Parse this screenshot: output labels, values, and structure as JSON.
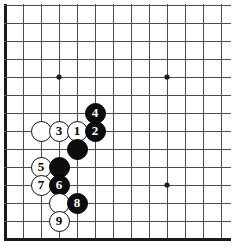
{
  "diagram": {
    "type": "go-board-corner-diagram",
    "board": {
      "columns": 13,
      "rows": 14,
      "origin_x": 5,
      "origin_y": 5,
      "spacing": 18,
      "line_color": "#4d4d4d",
      "border_color": "#1a1a1a",
      "background_color": "#ffffff"
    },
    "star_points": [
      {
        "name": "star-point-1",
        "col": 4,
        "row": 5
      },
      {
        "name": "star-point-2",
        "col": 10,
        "row": 5
      },
      {
        "name": "star-point-3",
        "col": 10,
        "row": 11
      }
    ],
    "stones": [
      {
        "name": "stone-white-unnumbered-c3r8",
        "color": "white",
        "label": "",
        "col": 3,
        "row": 8
      },
      {
        "name": "stone-white-3",
        "color": "white",
        "label": "3",
        "col": 4,
        "row": 8
      },
      {
        "name": "stone-white-1",
        "color": "white",
        "label": "1",
        "col": 5,
        "row": 8
      },
      {
        "name": "stone-black-2",
        "color": "black",
        "label": "2",
        "col": 6,
        "row": 8
      },
      {
        "name": "stone-black-4",
        "color": "black",
        "label": "4",
        "col": 6,
        "row": 7
      },
      {
        "name": "stone-black-unnumbered-c5r9",
        "color": "black",
        "label": "",
        "col": 5,
        "row": 9
      },
      {
        "name": "stone-white-5",
        "color": "white",
        "label": "5",
        "col": 3,
        "row": 10
      },
      {
        "name": "stone-black-unnumbered-c4r10",
        "color": "black",
        "label": "",
        "col": 4,
        "row": 10
      },
      {
        "name": "stone-white-7",
        "color": "white",
        "label": "7",
        "col": 3,
        "row": 11
      },
      {
        "name": "stone-black-6",
        "color": "black",
        "label": "6",
        "col": 4,
        "row": 11
      },
      {
        "name": "stone-white-unnumbered-c4r12",
        "color": "white",
        "label": "",
        "col": 4,
        "row": 12
      },
      {
        "name": "stone-black-8",
        "color": "black",
        "label": "8",
        "col": 5,
        "row": 12
      },
      {
        "name": "stone-white-9",
        "color": "white",
        "label": "9",
        "col": 4,
        "row": 13
      }
    ]
  }
}
